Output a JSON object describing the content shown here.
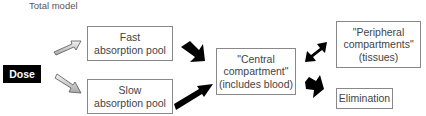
{
  "title": "Total model",
  "nodes": {
    "dose": "Dose",
    "fast_pool": {
      "line1": "Fast",
      "line2": "absorption pool"
    },
    "slow_pool": {
      "line1": "Slow",
      "line2": "absorption pool"
    },
    "central": {
      "line1": "\"Central",
      "line2": "compartment\"",
      "line3": "(includes blood)"
    },
    "peripheral": {
      "line1": "\"Peripheral",
      "line2": "compartments\"",
      "line3": "(tissues)"
    },
    "elimination": "Elimination"
  },
  "edges": [
    {
      "from": "dose",
      "to": "fast_pool",
      "style": "light-arrow"
    },
    {
      "from": "dose",
      "to": "slow_pool",
      "style": "light-arrow"
    },
    {
      "from": "fast_pool",
      "to": "central",
      "style": "black-bent-arrow"
    },
    {
      "from": "slow_pool",
      "to": "central",
      "style": "black-arrow"
    },
    {
      "from": "central",
      "to": "peripheral",
      "style": "black-double-arrow"
    },
    {
      "from": "central",
      "to": "elimination",
      "style": "black-bent-arrow"
    }
  ],
  "colors": {
    "dose_bg": "#000000",
    "box_border": "#888888",
    "arrow_dark": "#000000",
    "arrow_light": "#d8d8d8"
  }
}
